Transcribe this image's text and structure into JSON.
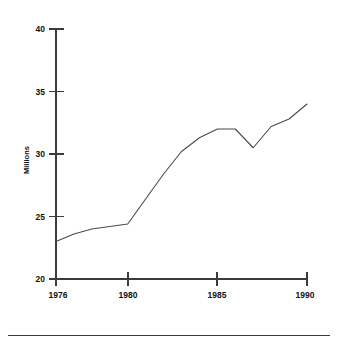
{
  "chart_data": {
    "type": "line",
    "title": "",
    "subtitle": "",
    "xlabel": "",
    "ylabel": "Millions",
    "xlim": [
      1976,
      1990
    ],
    "ylim": [
      20,
      40
    ],
    "grid": false,
    "legend": null,
    "x_ticks": [
      "1976",
      "1980",
      "1985",
      "1990"
    ],
    "x_tick_values": [
      1976,
      1980,
      1985,
      1990
    ],
    "y_ticks": [
      "20",
      "25",
      "30",
      "35",
      "40"
    ],
    "y_tick_values": [
      20,
      25,
      30,
      35,
      40
    ],
    "series": [
      {
        "name": "Millions",
        "color": "#4a4a4a",
        "x": [
          1976,
          1977,
          1978,
          1979,
          1980,
          1981,
          1982,
          1983,
          1984,
          1985,
          1986,
          1987,
          1988,
          1989,
          1990
        ],
        "values": [
          23.0,
          23.6,
          24.0,
          24.2,
          24.4,
          26.4,
          28.4,
          30.2,
          31.3,
          32.0,
          32.0,
          30.5,
          32.2,
          32.8,
          34.0
        ]
      }
    ],
    "annotations": []
  },
  "figure": {
    "background_color": "#ffffff",
    "line_color": "#4a4a4a",
    "axis_color": "#3c3c3c",
    "footer_rule": true
  }
}
